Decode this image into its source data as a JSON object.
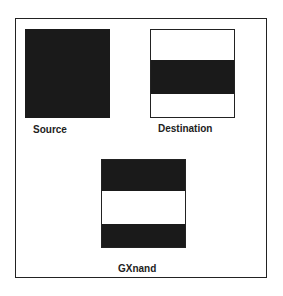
{
  "diagram": {
    "source": {
      "label": "Source",
      "fill": "#1a1a1a"
    },
    "destination": {
      "label": "Destination",
      "background": "#ffffff",
      "band": "#1a1a1a"
    },
    "result": {
      "label": "GXnand",
      "background": "#ffffff",
      "band": "#1a1a1a"
    }
  }
}
